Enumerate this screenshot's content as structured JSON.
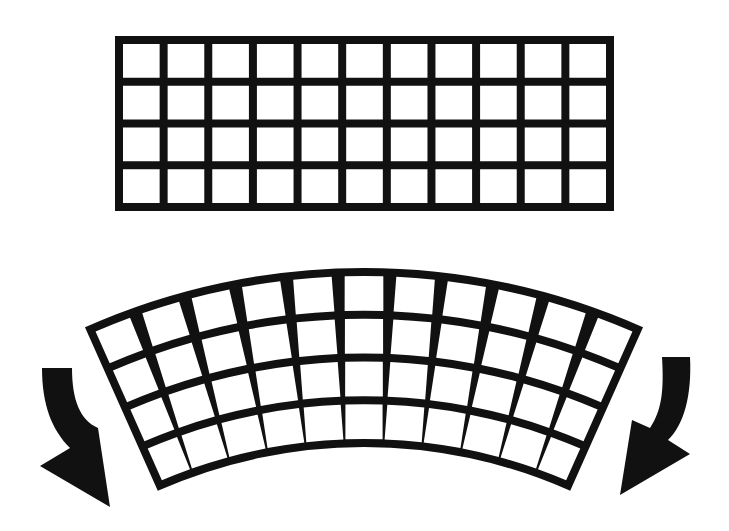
{
  "figure": {
    "colors": {
      "ink": "#111111",
      "background": "#ffffff",
      "cell": "#ffffff"
    }
  },
  "flat_grid": {
    "columns": 11,
    "rows": 4,
    "x": 115,
    "y": 36,
    "width": 499,
    "height": 175,
    "line_width": 8
  },
  "curved_grid": {
    "columns": 11,
    "rows": 4,
    "center_x": 364,
    "center_y": 954,
    "outer_radius": 686,
    "inner_radius": 507,
    "half_angle_deg": 24,
    "ring_line_width": 8,
    "spoke_top_width": 13,
    "spoke_bottom_width": 2
  },
  "arrows": [
    {
      "name": "left-bend-arrow",
      "direction": "down-right",
      "side": "left"
    },
    {
      "name": "right-bend-arrow",
      "direction": "down-left",
      "side": "right"
    }
  ]
}
